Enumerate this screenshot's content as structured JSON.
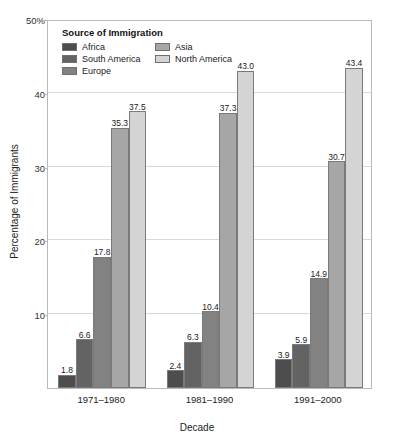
{
  "chart_data": {
    "type": "bar",
    "title": "",
    "subtitle": "",
    "xlabel": "Decade",
    "ylabel": "Percentage of Immigrants",
    "categories": [
      "1971–1980",
      "1981–1990",
      "1991–2000"
    ],
    "series": [
      {
        "name": "Africa",
        "color": "#4d4d4d",
        "values": [
          1.8,
          2.4,
          3.9
        ]
      },
      {
        "name": "South America",
        "color": "#636363",
        "values": [
          6.6,
          6.3,
          5.9
        ]
      },
      {
        "name": "Europe",
        "color": "#828282",
        "values": [
          17.8,
          10.4,
          14.9
        ]
      },
      {
        "name": "Asia",
        "color": "#a6a6a6",
        "values": [
          35.3,
          37.3,
          30.7
        ]
      },
      {
        "name": "North America",
        "color": "#d4d4d4",
        "values": [
          37.5,
          43.0,
          43.4
        ]
      }
    ],
    "ylim": [
      0,
      50
    ],
    "yticks": [
      10,
      20,
      30,
      40,
      50
    ],
    "ytick_labels": [
      "10",
      "20",
      "30",
      "40",
      "50%"
    ],
    "grid": true,
    "legend_position": "upper-left-inside",
    "legend_title": "Source of Immigration",
    "data_labels": true
  },
  "legend": {
    "title": "Source of Immigration",
    "entries": [
      {
        "label": "Africa",
        "color": "#4d4d4d"
      },
      {
        "label": "South America",
        "color": "#636363"
      },
      {
        "label": "Europe",
        "color": "#828282"
      },
      {
        "label": "Asia",
        "color": "#a6a6a6"
      },
      {
        "label": "North America",
        "color": "#d4d4d4"
      }
    ]
  },
  "axes": {
    "y_title": "Percentage of Immigrants",
    "x_title": "Decade",
    "y_ticks": [
      "50%",
      "40",
      "30",
      "20",
      "10"
    ],
    "x_ticks": [
      "1971–1980",
      "1981–1990",
      "1991–2000"
    ]
  },
  "colors": {
    "plot_border": "#b9b9b9",
    "gridline": "#d9d9d9",
    "bar_border": "#7a7a7a",
    "text": "#1a1a1a",
    "background": "#ffffff"
  }
}
